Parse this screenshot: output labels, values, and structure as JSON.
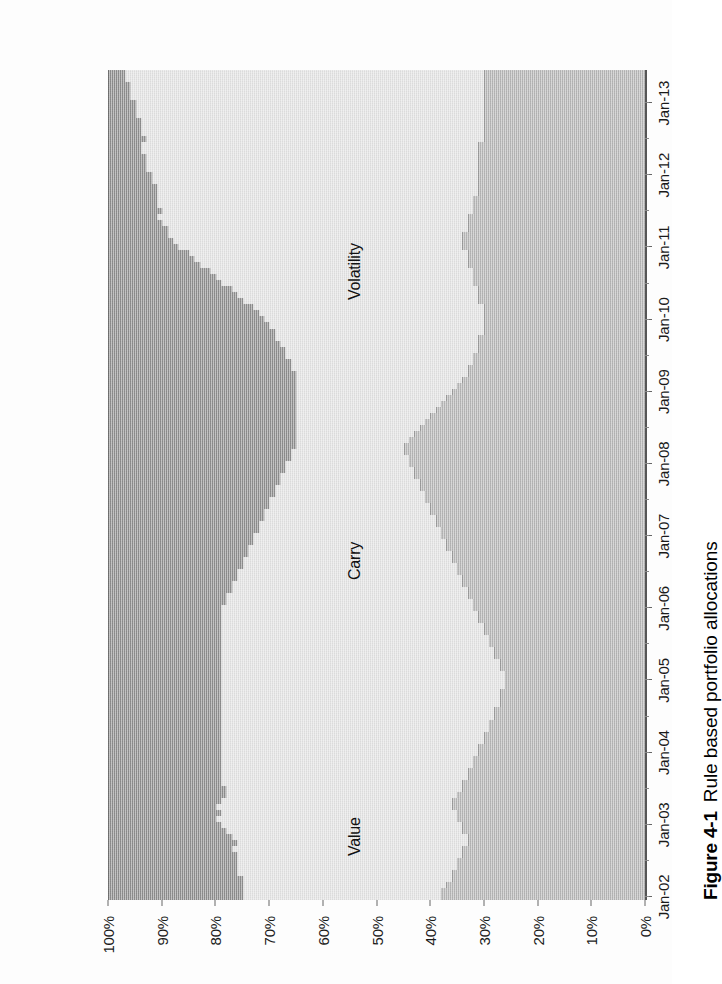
{
  "caption": {
    "number": "Figure 4-1",
    "text": "Rule based portfolio allocations"
  },
  "chart_data": {
    "type": "bar",
    "subtype": "stacked-100-percent",
    "title": "Rule based portfolio allocations",
    "xlabel": "",
    "ylabel": "",
    "ylim": [
      0,
      100
    ],
    "ytick_labels": [
      "0%",
      "10%",
      "20%",
      "30%",
      "40%",
      "50%",
      "60%",
      "70%",
      "80%",
      "90%",
      "100%"
    ],
    "ytick_values": [
      0,
      10,
      20,
      30,
      40,
      50,
      60,
      70,
      80,
      90,
      100
    ],
    "grid": false,
    "legend_position": "in-plot-annotations",
    "xtick_labels": [
      "Jan-02",
      "Jan-03",
      "Jan-04",
      "Jan-05",
      "Jan-06",
      "Jan-07",
      "Jan-08",
      "Jan-09",
      "Jan-10",
      "Jan-11",
      "Jan-12",
      "Jan-13"
    ],
    "annotations": [
      {
        "label": "Value",
        "series": "Value"
      },
      {
        "label": "Carry",
        "series": "Carry"
      },
      {
        "label": "Volatility",
        "series": "Volatility"
      }
    ],
    "colors": {
      "Value": "#8c8c8c",
      "Carry": "#e2e2e2",
      "Volatility": "#b4b4b4"
    },
    "categories": [
      "Jan-02",
      "Feb-02",
      "Mar-02",
      "Apr-02",
      "May-02",
      "Jun-02",
      "Jul-02",
      "Aug-02",
      "Sep-02",
      "Oct-02",
      "Nov-02",
      "Dec-02",
      "Jan-03",
      "Feb-03",
      "Mar-03",
      "Apr-03",
      "May-03",
      "Jun-03",
      "Jul-03",
      "Aug-03",
      "Sep-03",
      "Oct-03",
      "Nov-03",
      "Dec-03",
      "Jan-04",
      "Feb-04",
      "Mar-04",
      "Apr-04",
      "May-04",
      "Jun-04",
      "Jul-04",
      "Aug-04",
      "Sep-04",
      "Oct-04",
      "Nov-04",
      "Dec-04",
      "Jan-05",
      "Feb-05",
      "Mar-05",
      "Apr-05",
      "May-05",
      "Jun-05",
      "Jul-05",
      "Aug-05",
      "Sep-05",
      "Oct-05",
      "Nov-05",
      "Dec-05",
      "Jan-06",
      "Feb-06",
      "Mar-06",
      "Apr-06",
      "May-06",
      "Jun-06",
      "Jul-06",
      "Aug-06",
      "Sep-06",
      "Oct-06",
      "Nov-06",
      "Dec-06",
      "Jan-07",
      "Feb-07",
      "Mar-07",
      "Apr-07",
      "May-07",
      "Jun-07",
      "Jul-07",
      "Aug-07",
      "Sep-07",
      "Oct-07",
      "Nov-07",
      "Dec-07",
      "Jan-08",
      "Feb-08",
      "Mar-08",
      "Apr-08",
      "May-08",
      "Jun-08",
      "Jul-08",
      "Aug-08",
      "Sep-08",
      "Oct-08",
      "Nov-08",
      "Dec-08",
      "Jan-09",
      "Feb-09",
      "Mar-09",
      "Apr-09",
      "May-09",
      "Jun-09",
      "Jul-09",
      "Aug-09",
      "Sep-09",
      "Oct-09",
      "Nov-09",
      "Dec-09",
      "Jan-10",
      "Feb-10",
      "Mar-10",
      "Apr-10",
      "May-10",
      "Jun-10",
      "Jul-10",
      "Aug-10",
      "Sep-10",
      "Oct-10",
      "Nov-10",
      "Dec-10",
      "Jan-11",
      "Feb-11",
      "Mar-11",
      "Apr-11",
      "May-11",
      "Jun-11",
      "Jul-11",
      "Aug-11",
      "Sep-11",
      "Oct-11",
      "Nov-11",
      "Dec-11",
      "Jan-12",
      "Feb-12",
      "Mar-12",
      "Apr-12",
      "May-12",
      "Jun-12",
      "Jul-12",
      "Aug-12",
      "Sep-12",
      "Oct-12",
      "Nov-12",
      "Dec-12",
      "Jan-13",
      "Feb-13",
      "Mar-13",
      "Apr-13",
      "May-13",
      "Jun-13"
    ],
    "series": [
      {
        "name": "Volatility",
        "color": "#b4b4b4",
        "values": [
          38,
          38,
          37,
          36,
          36,
          35,
          35,
          34,
          34,
          33,
          33,
          34,
          34,
          35,
          35,
          36,
          36,
          35,
          34,
          34,
          33,
          33,
          32,
          32,
          31,
          31,
          30,
          30,
          29,
          29,
          28,
          28,
          27,
          27,
          27,
          26,
          26,
          26,
          27,
          27,
          28,
          28,
          29,
          29,
          30,
          30,
          31,
          31,
          32,
          32,
          33,
          33,
          34,
          34,
          35,
          35,
          36,
          36,
          37,
          37,
          38,
          38,
          39,
          39,
          40,
          40,
          41,
          41,
          42,
          42,
          43,
          43,
          44,
          44,
          45,
          45,
          44,
          43,
          42,
          41,
          40,
          39,
          38,
          37,
          36,
          35,
          34,
          33,
          33,
          32,
          32,
          31,
          31,
          31,
          30,
          30,
          30,
          30,
          30,
          31,
          31,
          31,
          32,
          32,
          32,
          33,
          33,
          33,
          34,
          34,
          34,
          33,
          33,
          33,
          32,
          32,
          32,
          31,
          31,
          31,
          31,
          31,
          31,
          31,
          31,
          31,
          30,
          30,
          30,
          30,
          30,
          30,
          30,
          30,
          30,
          30,
          30,
          30
        ]
      },
      {
        "name": "Carry",
        "color": "#e2e2e2",
        "values": [
          37,
          37,
          38,
          39,
          40,
          41,
          41,
          42,
          43,
          43,
          44,
          44,
          45,
          45,
          44,
          44,
          43,
          43,
          44,
          45,
          46,
          46,
          47,
          47,
          48,
          48,
          49,
          49,
          50,
          50,
          51,
          51,
          52,
          52,
          52,
          53,
          53,
          53,
          52,
          52,
          51,
          51,
          50,
          50,
          49,
          49,
          48,
          48,
          47,
          46,
          45,
          44,
          43,
          42,
          41,
          40,
          39,
          38,
          37,
          36,
          35,
          34,
          33,
          32,
          31,
          30,
          29,
          28,
          27,
          26,
          25,
          24,
          23,
          22,
          21,
          20,
          21,
          22,
          23,
          24,
          25,
          26,
          27,
          28,
          29,
          30,
          31,
          32,
          33,
          34,
          35,
          36,
          37,
          38,
          39,
          40,
          41,
          42,
          43,
          44,
          45,
          46,
          47,
          48,
          49,
          50,
          51,
          52,
          53,
          54,
          55,
          56,
          57,
          58,
          58,
          59,
          59,
          60,
          60,
          61,
          61,
          62,
          62,
          62,
          63,
          63,
          63,
          64,
          64,
          64,
          65,
          65,
          65,
          66,
          66,
          66,
          67,
          67
        ]
      },
      {
        "name": "Value",
        "color": "#8c8c8c",
        "values": [
          25,
          25,
          25,
          25,
          24,
          24,
          24,
          24,
          23,
          24,
          23,
          22,
          21,
          20,
          21,
          20,
          21,
          22,
          22,
          21,
          21,
          21,
          21,
          21,
          21,
          21,
          21,
          21,
          21,
          21,
          21,
          21,
          21,
          21,
          21,
          21,
          21,
          21,
          21,
          21,
          21,
          21,
          21,
          21,
          21,
          21,
          21,
          21,
          21,
          22,
          22,
          23,
          23,
          24,
          24,
          25,
          25,
          26,
          26,
          27,
          27,
          28,
          28,
          29,
          29,
          30,
          30,
          31,
          31,
          32,
          32,
          33,
          33,
          34,
          34,
          35,
          35,
          35,
          35,
          35,
          35,
          35,
          35,
          35,
          35,
          35,
          35,
          35,
          34,
          34,
          33,
          33,
          32,
          31,
          31,
          30,
          29,
          28,
          27,
          25,
          24,
          23,
          21,
          20,
          19,
          17,
          16,
          15,
          13,
          12,
          11,
          11,
          10,
          9,
          10,
          9,
          9,
          9,
          9,
          8,
          8,
          7,
          7,
          7,
          6,
          6,
          7,
          6,
          6,
          6,
          5,
          5,
          5,
          4,
          4,
          4,
          3,
          3
        ]
      }
    ]
  },
  "series_labels": {
    "value": "Value",
    "carry": "Carry",
    "volatility": "Volatility"
  }
}
